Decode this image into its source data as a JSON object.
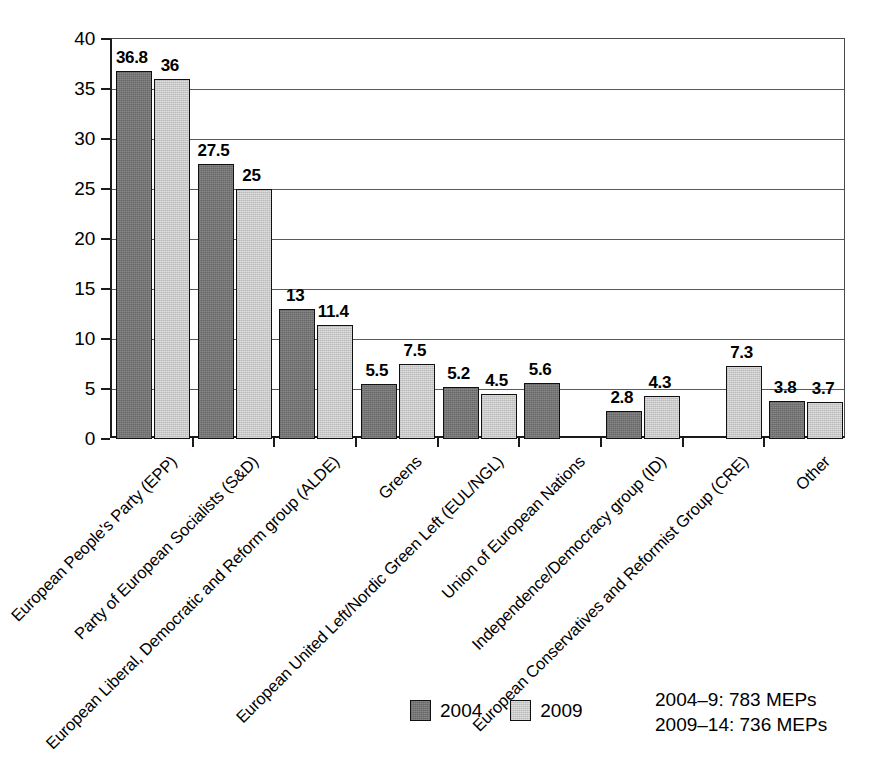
{
  "chart_data": {
    "type": "bar",
    "title": "",
    "subtitle": "",
    "xlabel": "",
    "ylabel": "",
    "ylim": [
      0,
      40
    ],
    "ytick_step": 5,
    "yticks": [
      "0",
      "5",
      "10",
      "15",
      "20",
      "25",
      "30",
      "35",
      "40"
    ],
    "grid": true,
    "legend_position": "bottom-center",
    "categories": [
      "European People's Party (EPP)",
      "Party of European Socialists (S&D)",
      "European Liberal, Democratic and Reform group (ALDE)",
      "Greens",
      "European United Left/Nordic Green Left (EUL/NGL)",
      "Union of European Nations",
      "Independence/Democracy group (ID)",
      "European Conservatives and Reformist Group (CRE)",
      "Other"
    ],
    "series": [
      {
        "name": "2004",
        "color": "#747474",
        "values": [
          36.8,
          27.5,
          13,
          5.5,
          5.2,
          5.6,
          2.8,
          null,
          3.8
        ],
        "labels": [
          "36.8",
          "27.5",
          "13",
          "5.5",
          "5.2",
          "5.6",
          "2.8",
          "",
          "3.8"
        ]
      },
      {
        "name": "2009",
        "color": "#c9c9c9",
        "values": [
          36,
          25,
          11.4,
          7.5,
          4.5,
          null,
          4.3,
          7.3,
          3.7
        ],
        "labels": [
          "36",
          "25",
          "11.4",
          "7.5",
          "4.5",
          "",
          "4.3",
          "7.3",
          "3.7"
        ]
      }
    ],
    "annotations": [
      "2004–9: 783 MEPs",
      "2009–14: 736 MEPs"
    ]
  },
  "legend": {
    "items": [
      {
        "label": "2004"
      },
      {
        "label": "2009"
      }
    ]
  },
  "footnote": {
    "line1": "2004–9: 783 MEPs",
    "line2": "2009–14: 736 MEPs"
  }
}
